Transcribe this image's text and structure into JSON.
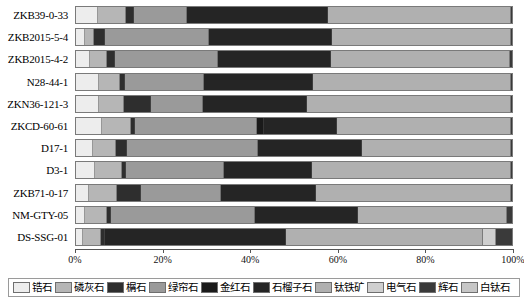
{
  "chart_data": {
    "type": "bar",
    "orientation": "horizontal",
    "stacked": true,
    "normalized_percent": true,
    "title": "",
    "xlabel": "",
    "ylabel": "",
    "xlim": [
      0,
      100
    ],
    "xticks": [
      0,
      20,
      40,
      60,
      80,
      100
    ],
    "xtick_labels": [
      "0%",
      "20%",
      "40%",
      "60%",
      "80%",
      "100%"
    ],
    "grid": false,
    "legend_position": "bottom",
    "categories": [
      "ZKB39-0-33",
      "ZKB2015-5-4",
      "ZKB2015-4-2",
      "N28-44-1",
      "ZKN36-121-3",
      "ZKCD-60-61",
      "D17-1",
      "D3-1",
      "ZKB71-0-17",
      "NM-GTY-05",
      "DS-SSG-01"
    ],
    "series": [
      {
        "name": "锆石",
        "color": "#ededed",
        "values": [
          5.0,
          2.0,
          3.2,
          5.2,
          5.3,
          6.0,
          3.8,
          4.4,
          3.0,
          2.0,
          1.5
        ]
      },
      {
        "name": "磷灰石",
        "color": "#b6b6b6",
        "values": [
          6.4,
          2.1,
          3.8,
          5.0,
          5.6,
          6.6,
          5.3,
          6.2,
          6.4,
          5.0,
          4.2
        ]
      },
      {
        "name": "榍石",
        "color": "#2e2e2e",
        "values": [
          1.8,
          2.6,
          2.0,
          1.0,
          6.2,
          1.0,
          2.6,
          0.9,
          5.6,
          1.0,
          1.0
        ]
      },
      {
        "name": "绿帘石",
        "color": "#9a9a9a",
        "values": [
          12.2,
          23.8,
          23.6,
          18.2,
          12.1,
          28.0,
          30.1,
          22.4,
          18.2,
          33.0,
          0.0
        ]
      },
      {
        "name": "金红石",
        "color": "#1a1a1a",
        "values": [
          0.0,
          0.0,
          0.0,
          0.0,
          0.0,
          1.6,
          0.0,
          0.0,
          0.0,
          0.0,
          0.0
        ]
      },
      {
        "name": "石榴子石",
        "color": "#252525",
        "values": [
          32.4,
          28.2,
          25.8,
          25.0,
          23.8,
          16.6,
          23.8,
          20.3,
          21.8,
          23.6,
          41.4
        ]
      },
      {
        "name": "钛铁矿",
        "color": "#b0b0b0",
        "values": [
          41.9,
          41.0,
          41.2,
          45.4,
          46.8,
          40.0,
          34.2,
          45.6,
          44.8,
          34.2,
          45.2
        ]
      },
      {
        "name": "电气石",
        "color": "#cfcfcf",
        "values": [
          0.0,
          0.0,
          0.0,
          0.0,
          0.0,
          0.0,
          0.0,
          0.0,
          0.0,
          0.0,
          3.0
        ]
      },
      {
        "name": "辉石",
        "color": "#3a3a3a",
        "values": [
          0.3,
          0.3,
          0.4,
          0.2,
          0.2,
          0.2,
          0.2,
          0.2,
          0.2,
          1.2,
          3.7
        ]
      },
      {
        "name": "白钛石",
        "color": "#c6c6c6",
        "values": [
          0.0,
          0.0,
          0.0,
          0.0,
          0.0,
          0.0,
          0.0,
          0.0,
          0.0,
          0.0,
          0.0
        ]
      }
    ]
  },
  "legend": {
    "items": [
      {
        "label": "锆石",
        "color": "#ededed"
      },
      {
        "label": "磷灰石",
        "color": "#b6b6b6"
      },
      {
        "label": "榍石",
        "color": "#2e2e2e"
      },
      {
        "label": "绿帘石",
        "color": "#9a9a9a"
      },
      {
        "label": "金红石",
        "color": "#1a1a1a"
      },
      {
        "label": "石榴子石",
        "color": "#252525"
      },
      {
        "label": "钛铁矿",
        "color": "#b0b0b0"
      },
      {
        "label": "电气石",
        "color": "#cfcfcf"
      },
      {
        "label": "辉石",
        "color": "#3a3a3a"
      },
      {
        "label": "白钛石",
        "color": "#c6c6c6"
      }
    ]
  }
}
